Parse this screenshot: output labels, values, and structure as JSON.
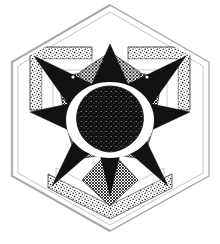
{
  "artwork": {
    "title": "Hexagonal Star Mandala",
    "medium": "pen and ink halftone drawing",
    "canvas": {
      "width": 220,
      "height": 244,
      "background": "#ffffff"
    },
    "symmetry": "three-fold rotational (C3) with vertical mirror",
    "colors": {
      "background": "#ffffff",
      "ink_black": "#121212",
      "ink_line": "#8a8a8a",
      "frame_line": "#9a9a9a",
      "stipple_ink": "#1b1b1b",
      "hatch_ink": "#1a1a1a",
      "dot_ink": "#161616",
      "core_ink": "#0d0d0d",
      "paper_shadow": "#d9d9d9"
    },
    "frame": {
      "name": "outer-hexagon",
      "stroke": "#9a9a9a",
      "stroke_width": 1.1,
      "points": "110,5 209,62 209,176 110,231 12,176 12,62",
      "inner_points": "110,12 203,66 203,173 110,225 18,173 18,66"
    },
    "elements": [
      {
        "name": "stipple-band-top-left",
        "texture": "stipple",
        "note": "dotted L-shaped band upper left"
      },
      {
        "name": "stipple-band-top-right",
        "texture": "stipple",
        "note": "dotted L-shaped band upper right"
      },
      {
        "name": "stipple-band-bottom",
        "texture": "stipple",
        "note": "dotted chevron band at bottom"
      },
      {
        "name": "hatch-square-upper-left",
        "texture": "crosshatch",
        "note": "fine cross-hatched tilted square"
      },
      {
        "name": "hatch-square-upper-right",
        "texture": "crosshatch",
        "note": "fine cross-hatched tilted square"
      },
      {
        "name": "hatch-diamond-bottom",
        "texture": "crosshatch",
        "note": "cross-hatched diamond bottom centre"
      },
      {
        "name": "halftone-square-left",
        "texture": "halftone-dots",
        "note": "dense dotted square mid left"
      },
      {
        "name": "halftone-square-right",
        "texture": "halftone-dots",
        "note": "dense dotted square mid right"
      },
      {
        "name": "halftone-fan-top",
        "texture": "fine-grid",
        "note": "checkered fan shape above centre"
      },
      {
        "name": "black-six-point-star",
        "texture": "solid-black",
        "note": "large solid black star"
      },
      {
        "name": "speckled-core",
        "texture": "coarse-speckle",
        "note": "dark rounded blob at centre"
      },
      {
        "name": "highlight-dot-left",
        "texture": "solid-white",
        "note": "tiny white dot in left star arm"
      },
      {
        "name": "highlight-dot-right",
        "texture": "solid-white",
        "note": "tiny white dot in right star arm"
      }
    ],
    "geometry": {
      "center": {
        "x": 110,
        "y": 118
      },
      "core_radius": 30,
      "star_outer_radius": 80,
      "star_inner_radius": 33
    }
  }
}
